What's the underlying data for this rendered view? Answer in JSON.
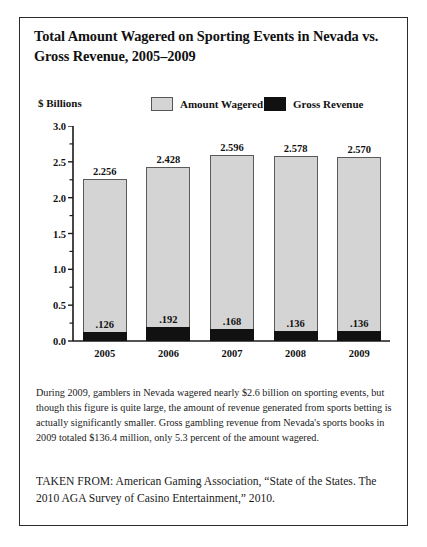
{
  "figure": {
    "title": "Total Amount Wagered on Sporting Events in Nevada vs. Gross Revenue, 2005–2009",
    "caption": "During 2009, gamblers in Nevada wagered nearly $2.6 billion on sporting events, but though this figure is quite large, the amount of revenue generated from sports betting is actually significantly smaller. Gross gambling revenue from Nevada's sports books in 2009 totaled $136.4 million, only 5.3 percent of the amount wagered.",
    "source": "TAKEN FROM: American Gaming Association, “State of the States. The 2010 AGA Survey of Casino Entertainment,” 2010."
  },
  "colors": {
    "wagered_fill": "#d4d4d4",
    "wagered_stroke": "#5a5a5a",
    "revenue_fill": "#111111",
    "axis": "#1a1a1a",
    "border": "#2b2b2b"
  },
  "chart_data": {
    "type": "bar",
    "title": "Total Amount Wagered on Sporting Events in Nevada vs. Gross Revenue, 2005–2009",
    "subtitle": "",
    "xlabel": "",
    "ylabel": "$ Billions",
    "unit_label": "$ Billions",
    "categories": [
      "2005",
      "2006",
      "2007",
      "2008",
      "2009"
    ],
    "series": [
      {
        "name": "Amount Wagered",
        "color": "#d4d4d4",
        "values": [
          2.256,
          2.428,
          2.596,
          2.578,
          2.57
        ],
        "labels": [
          "2.256",
          "2.428",
          "2.596",
          "2.578",
          "2.570"
        ]
      },
      {
        "name": "Gross Revenue",
        "color": "#111111",
        "values": [
          0.126,
          0.192,
          0.168,
          0.136,
          0.136
        ],
        "labels": [
          ".126",
          ".192",
          ".168",
          ".136",
          ".136"
        ]
      }
    ],
    "ylim": [
      0.0,
      3.0
    ],
    "ytick_labels": [
      "3.0",
      "2.5",
      "2.0",
      "1.5",
      "1.0",
      "0.5",
      "0.0"
    ],
    "ytick_values": [
      3.0,
      2.5,
      2.0,
      1.5,
      1.0,
      0.5,
      0.0
    ],
    "minor_tick_interval": 0.25,
    "grid": false,
    "legend_position": "top",
    "bar_mode": "overlaid"
  }
}
